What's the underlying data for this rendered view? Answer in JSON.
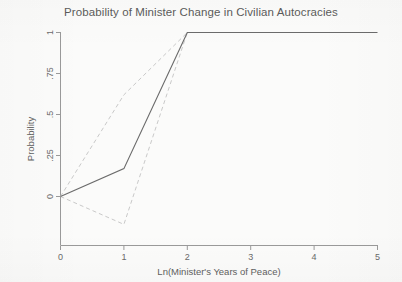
{
  "chart_data": {
    "type": "line",
    "title": "Probability of Minister Change in Civilian Autocracies",
    "xlabel": "Ln(Minister's Years of Peace)",
    "ylabel": "Probability",
    "xlim": [
      0,
      5
    ],
    "ylim": [
      -0.17,
      1
    ],
    "grid": false,
    "legend": "none",
    "xticks": [
      0,
      1,
      2,
      3,
      4,
      5
    ],
    "xticklabels": [
      "0",
      "1",
      "2",
      "3",
      "4",
      "5"
    ],
    "yticks": [
      0,
      0.25,
      0.5,
      0.75,
      1
    ],
    "yticklabels": [
      "0",
      ".25",
      ".5",
      ".75",
      "1"
    ],
    "x": [
      0,
      1,
      2,
      3,
      4,
      5
    ],
    "series": [
      {
        "name": "Predicted probability",
        "style": "solid",
        "color": "#6b6b6b",
        "values": [
          0,
          0.17,
          1,
          1,
          1,
          1
        ]
      },
      {
        "name": "Upper confidence bound",
        "style": "dashed",
        "color": "#c9c9c9",
        "values": [
          0,
          0.62,
          1,
          1,
          1,
          1
        ]
      },
      {
        "name": "Lower confidence bound",
        "style": "dashed",
        "color": "#c9c9c9",
        "values": [
          0,
          -0.17,
          1,
          1,
          1,
          1
        ]
      }
    ]
  }
}
